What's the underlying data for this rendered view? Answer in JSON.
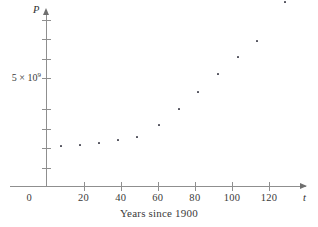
{
  "chart_data": {
    "type": "scatter",
    "title": "",
    "xlabel": "Years since 1900",
    "ylabel": "P",
    "x_axis_symbol": "t",
    "y_axis_symbol": "P",
    "xlim": [
      0,
      128
    ],
    "ylim": [
      0,
      9000000000
    ],
    "grid": false,
    "legend": null,
    "x_ticks": [
      {
        "value": 0,
        "label": "0"
      },
      {
        "value": 20,
        "label": "20"
      },
      {
        "value": 40,
        "label": "40"
      },
      {
        "value": 60,
        "label": "60"
      },
      {
        "value": 80,
        "label": "80"
      },
      {
        "value": 100,
        "label": "100"
      },
      {
        "value": 120,
        "label": "120"
      }
    ],
    "y_ticks": [
      {
        "value": 1000000000,
        "label": ""
      },
      {
        "value": 2000000000,
        "label": ""
      },
      {
        "value": 3000000000,
        "label": ""
      },
      {
        "value": 4000000000,
        "label": ""
      },
      {
        "value": 5000000000,
        "label": "5 × 10",
        "exponent": "9"
      },
      {
        "value": 6000000000,
        "label": ""
      },
      {
        "value": 7000000000,
        "label": ""
      },
      {
        "value": 8000000000,
        "label": ""
      }
    ],
    "y_tick_pixels": [
      168,
      148,
      129,
      109,
      78,
      59,
      39,
      20
    ],
    "series": [
      {
        "name": "World population",
        "marker": "square",
        "color": "#4a4a55",
        "points": [
          {
            "x": 10,
            "y": 1750000000,
            "px": 61,
            "py": 146
          },
          {
            "x": 20,
            "y": 1860000000,
            "px": 80,
            "py": 145
          },
          {
            "x": 30,
            "y": 2070000000,
            "px": 99,
            "py": 143
          },
          {
            "x": 40,
            "y": 2300000000,
            "px": 118,
            "py": 140
          },
          {
            "x": 50,
            "y": 2560000000,
            "px": 137,
            "py": 137
          },
          {
            "x": 60,
            "y": 3040000000,
            "px": 159,
            "py": 125
          },
          {
            "x": 70,
            "y": 3710000000,
            "px": 179,
            "py": 109
          },
          {
            "x": 80,
            "y": 4450000000,
            "px": 198,
            "py": 92
          },
          {
            "x": 90,
            "y": 5280000000,
            "px": 218,
            "py": 74
          },
          {
            "x": 100,
            "y": 6080000000,
            "px": 238,
            "py": 57
          },
          {
            "x": 110,
            "y": 6870000000,
            "px": 257,
            "py": 41
          },
          {
            "x": 125,
            "y": 8050000000,
            "px": 285,
            "py": 2
          }
        ]
      }
    ]
  },
  "axes": {
    "x_title": "Years since 1900",
    "x_symbol": "t",
    "y_symbol": "P",
    "origin_label": "0",
    "y_label_mantissa": "5 × 10",
    "y_label_exponent": "9"
  },
  "colors": {
    "axis": "#8f8f8f",
    "marker": "#4a4a55",
    "text": "#3a3a3a",
    "background": "#ffffff"
  }
}
